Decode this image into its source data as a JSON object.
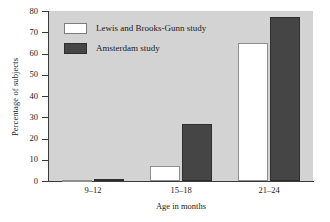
{
  "chart_data": {
    "type": "bar",
    "title": "",
    "xlabel": "Age in months",
    "ylabel": "Percentage of subjects",
    "categories": [
      "9–12",
      "15–18",
      "21–24"
    ],
    "series": [
      {
        "name": "Lewis and Brooks-Gunn study",
        "color": "#ffffff",
        "values": [
          0.5,
          7,
          65
        ]
      },
      {
        "name": "Amsterdam study",
        "color": "#454545",
        "values": [
          1,
          27,
          77
        ]
      }
    ],
    "ylim": [
      0,
      80
    ],
    "yticks": [
      0,
      10,
      20,
      30,
      40,
      50,
      60,
      70,
      80
    ],
    "ytick_labels": [
      "0",
      "10",
      "20",
      "30",
      "40",
      "50",
      "60",
      "70",
      "80"
    ],
    "grid": false,
    "legend_position": "upper-left-inside",
    "plot_background": "#d3d3d3",
    "figure_background": "#ffffff",
    "axis_color": "#3a3a3a"
  }
}
